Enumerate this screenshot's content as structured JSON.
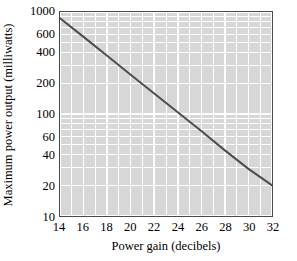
{
  "chart_data": {
    "type": "line",
    "title": "",
    "xlabel": "Power gain (decibels)",
    "ylabel": "Maximum power output (milliwatts)",
    "xscale": "linear",
    "yscale": "log",
    "xlim": [
      14,
      32
    ],
    "ylim": [
      10,
      1000
    ],
    "grid": true,
    "grid_minor": true,
    "legend": "none",
    "xticks": [
      14,
      16,
      18,
      20,
      22,
      24,
      26,
      28,
      30,
      32
    ],
    "xtick_labels": [
      "14",
      "16",
      "18",
      "20",
      "22",
      "24",
      "26",
      "28",
      "30",
      "32"
    ],
    "yticks": [
      10,
      20,
      40,
      60,
      100,
      200,
      400,
      600,
      1000
    ],
    "ytick_labels": [
      "10",
      "20",
      "40",
      "60",
      "100",
      "200",
      "400",
      "600",
      "1000"
    ],
    "x_minor_step": 1,
    "series": [
      {
        "name": "Maximum power output",
        "color": "#4d4d4d",
        "width": 2,
        "x": [
          14,
          32
        ],
        "values": [
          870,
          20
        ],
        "points": [
          {
            "x": 14,
            "y": 870
          },
          {
            "x": 16,
            "y": 570
          },
          {
            "x": 18,
            "y": 372
          },
          {
            "x": 20,
            "y": 243
          },
          {
            "x": 22,
            "y": 159
          },
          {
            "x": 24,
            "y": 104
          },
          {
            "x": 26,
            "y": 68
          },
          {
            "x": 28,
            "y": 44
          },
          {
            "x": 30,
            "y": 29
          },
          {
            "x": 32,
            "y": 20
          }
        ]
      }
    ]
  },
  "style": {
    "page_background": "#ffffff",
    "panel_background": "#d7d7d7",
    "grid_color": "#ffffff",
    "minor_grid_color": "#ededed",
    "frame_color": "#4a4a4a",
    "text_color": "#000000"
  }
}
